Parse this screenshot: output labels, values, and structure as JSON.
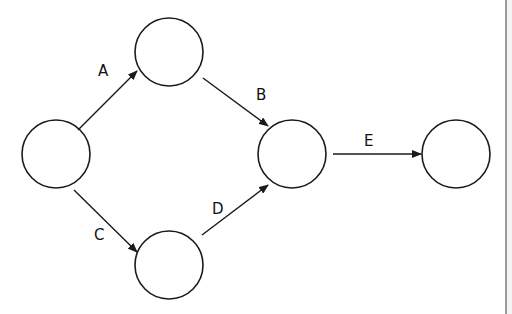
{
  "diagram": {
    "type": "activity-network",
    "colors": {
      "stroke": "#1a1a1a",
      "node_fill": "#ffffff",
      "label": "#111111",
      "border": "#9a9a9a"
    },
    "nodes": [
      {
        "id": "n1",
        "cx": 56,
        "cy": 154,
        "r": 34
      },
      {
        "id": "n2",
        "cx": 169,
        "cy": 52,
        "r": 34
      },
      {
        "id": "n3",
        "cx": 292,
        "cy": 154,
        "r": 34
      },
      {
        "id": "n4",
        "cx": 169,
        "cy": 265,
        "r": 34
      },
      {
        "id": "n5",
        "cx": 456,
        "cy": 154,
        "r": 34
      }
    ],
    "edges": [
      {
        "label": "A",
        "from": "n1",
        "to": "n2"
      },
      {
        "label": "B",
        "from": "n2",
        "to": "n3"
      },
      {
        "label": "C",
        "from": "n1",
        "to": "n4"
      },
      {
        "label": "D",
        "from": "n4",
        "to": "n3"
      },
      {
        "label": "E",
        "from": "n3",
        "to": "n5"
      }
    ]
  }
}
